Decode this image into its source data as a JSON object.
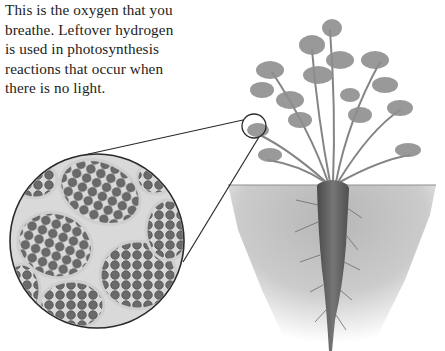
{
  "page": {
    "type": "textbook illustration",
    "background": "#ffffff"
  },
  "text": {
    "partial_top_line": "light energy into oxygen and hydrogen.",
    "lines": [
      "This is the oxygen that you",
      "breathe. Leftover hydrogen",
      "is used in photosynthesis",
      "reactions that occur when",
      "there is no light."
    ]
  },
  "figure": {
    "magnifier": {
      "small_circle": {
        "cx": 254,
        "cy": 126,
        "r": 12
      },
      "large_circle": {
        "cx": 97,
        "cy": 241,
        "r": 87
      },
      "content": "leaf cells with chloroplasts"
    },
    "parts": [
      "leafy-top",
      "stems",
      "soil",
      "carrot-root",
      "root-hairs"
    ],
    "colors": {
      "outline": "#2a2a2a",
      "cell_wall": "#d8d8d8",
      "chloroplast": "#6e6e6e",
      "leaf": "#8a8a8a",
      "soil": "#b5b5b5",
      "root": "#5a5a5a"
    }
  }
}
